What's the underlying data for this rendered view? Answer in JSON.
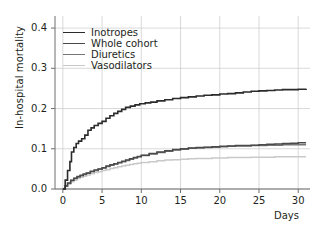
{
  "chart_data": {
    "type": "line",
    "title": "",
    "xlabel": "Days",
    "ylabel": "In-hospital mortality",
    "xlim": [
      -1,
      31.5
    ],
    "ylim": [
      0.0,
      0.43
    ],
    "xticks": [
      "0",
      "5",
      "10",
      "15",
      "20",
      "25",
      "30"
    ],
    "xtick_values": [
      0,
      5,
      10,
      15,
      20,
      25,
      30
    ],
    "yticks": [
      "0.0",
      "0.1",
      "0.2",
      "0.3",
      "0.4"
    ],
    "ytick_values": [
      0.0,
      0.1,
      0.2,
      0.3,
      0.4
    ],
    "grid": true,
    "legend_position": "upper left",
    "series": [
      {
        "name": "Inotropes",
        "color": "#2b2b2b",
        "width": 1.6,
        "final_value": 0.249,
        "x": [
          0,
          0.3,
          0.6,
          0.9,
          1.1,
          1.4,
          1.7,
          2.0,
          2.4,
          2.8,
          3.2,
          3.6,
          4.0,
          4.5,
          5.0,
          5.5,
          6.0,
          6.5,
          7.0,
          7.5,
          8.0,
          8.6,
          9.2,
          9.8,
          10.5,
          11.2,
          12.0,
          13.0,
          14.0,
          15.0,
          16.0,
          17.0,
          18.0,
          19.0,
          20.0,
          21.0,
          22.0,
          23.0,
          24.0,
          25.0,
          26.0,
          27.0,
          28.0,
          29.0,
          30.0,
          31.0
        ],
        "y": [
          0.0,
          0.022,
          0.046,
          0.068,
          0.092,
          0.103,
          0.113,
          0.119,
          0.125,
          0.134,
          0.146,
          0.152,
          0.158,
          0.163,
          0.168,
          0.176,
          0.182,
          0.188,
          0.193,
          0.198,
          0.203,
          0.206,
          0.209,
          0.212,
          0.214,
          0.216,
          0.219,
          0.222,
          0.225,
          0.227,
          0.229,
          0.231,
          0.233,
          0.234,
          0.236,
          0.237,
          0.239,
          0.241,
          0.243,
          0.244,
          0.245,
          0.246,
          0.247,
          0.247,
          0.248,
          0.249
        ]
      },
      {
        "name": "Whole cohort",
        "color": "#4a4a4a",
        "width": 1.5,
        "final_value": 0.115,
        "x": [
          0,
          0.3,
          0.6,
          1.0,
          1.4,
          1.8,
          2.2,
          2.6,
          3.0,
          3.5,
          4.0,
          4.5,
          5.0,
          5.5,
          6.0,
          6.5,
          7.0,
          7.5,
          8.0,
          8.5,
          9.0,
          9.5,
          10.0,
          11.0,
          12.0,
          13.0,
          14.0,
          15.0,
          16.0,
          17.0,
          18.0,
          19.0,
          20.0,
          21.0,
          22.0,
          23.0,
          24.0,
          25.0,
          26.0,
          27.0,
          28.0,
          29.0,
          30.0,
          31.0
        ],
        "y": [
          0.0,
          0.008,
          0.015,
          0.022,
          0.027,
          0.031,
          0.034,
          0.037,
          0.04,
          0.044,
          0.047,
          0.05,
          0.053,
          0.057,
          0.06,
          0.063,
          0.066,
          0.069,
          0.072,
          0.075,
          0.078,
          0.081,
          0.084,
          0.088,
          0.092,
          0.095,
          0.098,
          0.1,
          0.102,
          0.103,
          0.104,
          0.105,
          0.106,
          0.107,
          0.108,
          0.108,
          0.109,
          0.11,
          0.111,
          0.112,
          0.113,
          0.114,
          0.115,
          0.115
        ]
      },
      {
        "name": "Diuretics",
        "color": "#767676",
        "width": 1.5,
        "final_value": 0.11,
        "x": [
          0,
          0.3,
          0.6,
          1.0,
          1.4,
          1.8,
          2.2,
          2.6,
          3.0,
          3.5,
          4.0,
          4.5,
          5.0,
          5.5,
          6.0,
          6.5,
          7.0,
          7.5,
          8.0,
          8.5,
          9.0,
          9.5,
          10.0,
          11.0,
          12.0,
          13.0,
          14.0,
          15.0,
          16.0,
          17.0,
          18.0,
          19.0,
          20.0,
          21.0,
          22.0,
          23.0,
          24.0,
          25.0,
          26.0,
          27.0,
          28.0,
          29.0,
          30.0,
          31.0
        ],
        "y": [
          0.0,
          0.007,
          0.014,
          0.021,
          0.026,
          0.03,
          0.033,
          0.036,
          0.039,
          0.043,
          0.046,
          0.049,
          0.052,
          0.056,
          0.059,
          0.062,
          0.065,
          0.068,
          0.071,
          0.074,
          0.077,
          0.08,
          0.083,
          0.087,
          0.091,
          0.094,
          0.097,
          0.099,
          0.101,
          0.102,
          0.103,
          0.104,
          0.105,
          0.106,
          0.107,
          0.107,
          0.108,
          0.108,
          0.109,
          0.109,
          0.11,
          0.11,
          0.11,
          0.11
        ]
      },
      {
        "name": "Vasodilators",
        "color": "#c9c9c9",
        "width": 1.5,
        "final_value": 0.08,
        "x": [
          0,
          0.3,
          0.6,
          1.0,
          1.4,
          1.8,
          2.2,
          2.6,
          3.0,
          3.5,
          4.0,
          4.5,
          5.0,
          5.5,
          6.0,
          6.5,
          7.0,
          7.5,
          8.0,
          8.5,
          9.0,
          9.5,
          10.0,
          11.0,
          12.0,
          13.0,
          14.0,
          15.0,
          16.0,
          17.0,
          18.0,
          19.0,
          20.0,
          21.0,
          22.0,
          23.0,
          24.0,
          25.0,
          26.0,
          27.0,
          28.0,
          29.0,
          30.0,
          31.0
        ],
        "y": [
          0.0,
          0.006,
          0.012,
          0.018,
          0.022,
          0.026,
          0.029,
          0.032,
          0.035,
          0.038,
          0.041,
          0.043,
          0.046,
          0.048,
          0.051,
          0.053,
          0.055,
          0.057,
          0.059,
          0.061,
          0.063,
          0.064,
          0.066,
          0.068,
          0.07,
          0.072,
          0.073,
          0.074,
          0.075,
          0.076,
          0.076,
          0.077,
          0.077,
          0.078,
          0.078,
          0.078,
          0.079,
          0.079,
          0.079,
          0.08,
          0.08,
          0.08,
          0.08,
          0.08
        ]
      }
    ],
    "legend": [
      "Inotropes",
      "Whole cohort",
      "Diuretics",
      "Vasodilators"
    ],
    "grid_color": "#c8c8c8",
    "axis_color": "#6e6e6e"
  }
}
